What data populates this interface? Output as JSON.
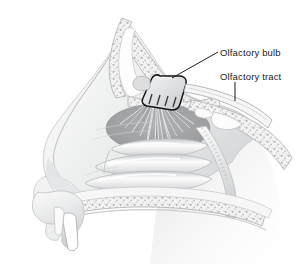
{
  "figure": {
    "background_color": "#ffffff",
    "style": "grayscale medical line illustration",
    "ink_color": "#1b1b1b",
    "tissue_light": "#f2f2f3",
    "tissue_mid": "#d8d9da",
    "tissue_dark": "#a9abad",
    "epithelium_color": "#9a9c9e",
    "bone_fill": "#ededee",
    "outline_color": "#b8babc"
  },
  "labels": {
    "bulb": "Olfactory bulb",
    "tract": "Olfactory tract"
  },
  "leaders": {
    "bulb": {
      "x1": 218,
      "y1": 52,
      "x2": 172,
      "y2": 78
    },
    "tract": {
      "x1": 235,
      "y1": 82,
      "x2": 235,
      "y2": 101
    }
  },
  "structures": [
    {
      "name": "frontal-sinus",
      "label_shown": false
    },
    {
      "name": "nasal-bridge",
      "label_shown": false
    },
    {
      "name": "cribriform-plate",
      "label_shown": false
    },
    {
      "name": "olfactory-bulb",
      "label_shown": true
    },
    {
      "name": "olfactory-tract",
      "label_shown": true
    },
    {
      "name": "olfactory-nerve-fibers",
      "label_shown": false
    },
    {
      "name": "olfactory-epithelium",
      "label_shown": false
    },
    {
      "name": "superior-turbinate",
      "label_shown": false
    },
    {
      "name": "middle-turbinate",
      "label_shown": false
    },
    {
      "name": "inferior-turbinate",
      "label_shown": false
    },
    {
      "name": "sphenoid-sinus",
      "label_shown": false
    },
    {
      "name": "hard-palate",
      "label_shown": false
    },
    {
      "name": "upper-lip",
      "label_shown": false
    },
    {
      "name": "incisor-tooth",
      "label_shown": false
    },
    {
      "name": "nasal-vestibule",
      "label_shown": false
    },
    {
      "name": "nasopharynx",
      "label_shown": false
    }
  ]
}
